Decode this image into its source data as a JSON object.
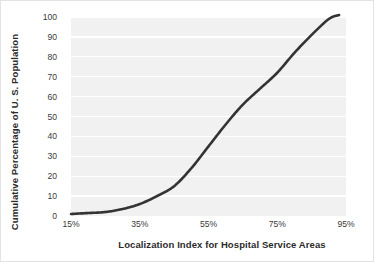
{
  "chart_data": {
    "type": "line",
    "title": "",
    "xlabel": "Localization Index for Hospital Service Areas",
    "ylabel": "Cumulative Percentage of U. S. Population",
    "xlim": [
      15,
      95
    ],
    "ylim": [
      0,
      100
    ],
    "grid": true,
    "legend": null,
    "xticks": [
      "15%",
      "35%",
      "55%",
      "75%",
      "95%"
    ],
    "xtick_values": [
      15,
      35,
      55,
      75,
      95
    ],
    "yticks": [
      "0",
      "10",
      "20",
      "30",
      "40",
      "50",
      "60",
      "70",
      "80",
      "90",
      "100"
    ],
    "ytick_values": [
      0,
      10,
      20,
      30,
      40,
      50,
      60,
      70,
      80,
      90,
      100
    ],
    "series": [
      {
        "name": "Cumulative percentage of U.S. population",
        "x": [
          15,
          20,
          25,
          30,
          35,
          40,
          45,
          50,
          55,
          60,
          65,
          70,
          75,
          80,
          85,
          90,
          93
        ],
        "values": [
          1,
          1.5,
          2,
          3.5,
          6,
          10,
          15,
          24,
          35,
          46,
          56,
          64,
          72,
          82,
          91,
          99,
          101
        ]
      }
    ],
    "colors": {
      "line": "#333333",
      "plot_background": "#f1f1f1",
      "gridline": "#ffffff",
      "text": "#2b2b2b",
      "page_background": "#ffffff"
    }
  }
}
